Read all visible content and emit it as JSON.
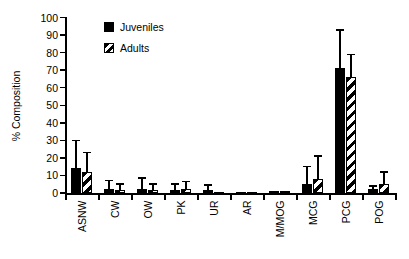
{
  "colors": {
    "foreground": "#000000",
    "background": "#ffffff"
  },
  "legend": {
    "items": [
      {
        "label": "Juveniles",
        "fill": "solid"
      },
      {
        "label": "Adults",
        "fill": "hatch"
      }
    ]
  },
  "chart_data": {
    "type": "bar",
    "title": "",
    "xlabel": "",
    "ylabel": "% Composition",
    "ylim": [
      0,
      100
    ],
    "ytick_step": 10,
    "ytick_labels": [
      "0",
      "10",
      "20",
      "30",
      "40",
      "50",
      "60",
      "70",
      "80",
      "90",
      "100"
    ],
    "grid": false,
    "legend_position": "upper-left-inside",
    "categories": [
      "ASNW",
      "CW",
      "OW",
      "PK",
      "UR",
      "AR",
      "M/MOG",
      "MCG",
      "PCG",
      "POG"
    ],
    "series": [
      {
        "name": "Juveniles",
        "fill": "solid",
        "color": "#000000",
        "values": [
          14,
          2.5,
          2.5,
          1.5,
          1.5,
          0.8,
          1,
          5,
          71,
          2
        ],
        "error_plus": [
          16,
          4.5,
          6,
          3.5,
          3,
          0,
          0,
          10,
          22,
          2
        ]
      },
      {
        "name": "Adults",
        "fill": "hatch",
        "color": "#000000",
        "values": [
          12,
          1.5,
          1.5,
          2,
          0.3,
          0.3,
          1,
          8,
          66,
          5
        ],
        "error_plus": [
          11,
          3.5,
          3.5,
          4.5,
          0,
          0,
          0,
          13,
          13,
          7
        ]
      }
    ]
  }
}
